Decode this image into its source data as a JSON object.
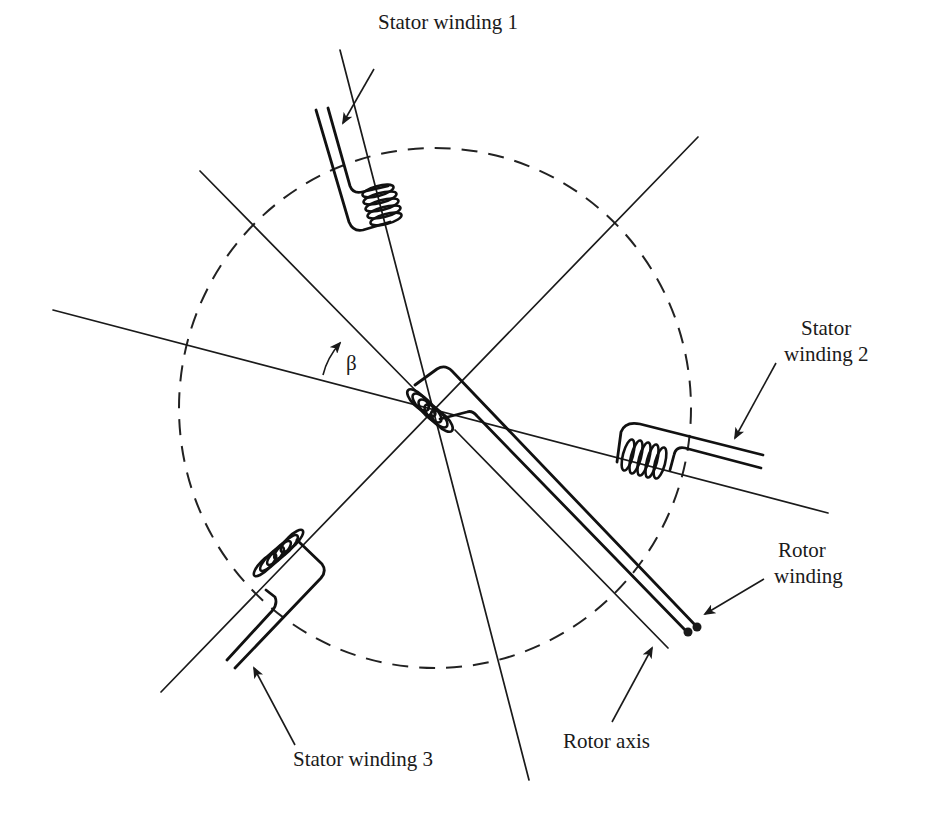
{
  "diagram": {
    "labels": {
      "stator1": "Stator winding 1",
      "stator2_line1": "Stator",
      "stator2_line2": "winding 2",
      "stator3": "Stator winding 3",
      "rotor_winding_line1": "Rotor",
      "rotor_winding_line2": "winding",
      "rotor_axis": "Rotor axis",
      "angle": "β"
    },
    "geometry": {
      "center": [
        435,
        408
      ],
      "circle_radius": 256,
      "stator_axes_deg": [
        -105,
        15,
        135
      ],
      "rotor_axis_deg": 47,
      "beta_description": "angle between stator axis and rotor axis"
    },
    "colors": {
      "line": "#1a1a1a",
      "background": "#ffffff"
    }
  }
}
